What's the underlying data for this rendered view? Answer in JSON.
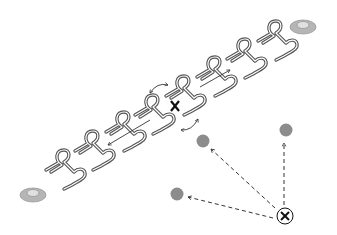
{
  "diagram": {
    "description": "Row of hairpin-shaped pins between two end anchors; one pin removed (X), neighbouring pins rotate; dashed arrows from a defect (circled X) to three grey sites",
    "colors": {
      "pin_stroke": "#555555",
      "pin_inner": "#ffffff",
      "arrow": "#333333",
      "site_fill": "#8c8c8c",
      "anchor_outer": "#b0b0b0",
      "anchor_inner": "#d9d9d9",
      "defect_stroke": "#111111"
    },
    "anchors": [
      {
        "name": "anchor-left",
        "x": 33,
        "y": 195
      },
      {
        "name": "anchor-right",
        "x": 303,
        "y": 27
      }
    ],
    "pins": [
      {
        "id": 1,
        "x": 60,
        "y": 162
      },
      {
        "id": 2,
        "x": 89,
        "y": 143
      },
      {
        "id": 3,
        "x": 120,
        "y": 124
      },
      {
        "id": 4,
        "x": 149,
        "y": 107
      },
      {
        "id": 5,
        "x": 180,
        "y": 88
      },
      {
        "id": 6,
        "x": 211,
        "y": 69
      },
      {
        "id": 7,
        "x": 241,
        "y": 51
      },
      {
        "id": 8,
        "x": 272,
        "y": 33
      }
    ],
    "vacancy_marker": {
      "symbol": "✕",
      "x": 175,
      "y": 106
    },
    "defect_marker": {
      "symbol": "⊗",
      "x": 285,
      "y": 216
    },
    "sites": [
      {
        "name": "site-upper-right",
        "x": 286,
        "y": 130
      },
      {
        "name": "site-middle",
        "x": 203,
        "y": 141
      },
      {
        "name": "site-lower-left",
        "x": 177,
        "y": 194
      }
    ]
  }
}
